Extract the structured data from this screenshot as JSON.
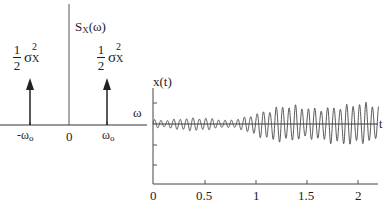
{
  "chart_data": [
    {
      "type": "spectral-impulses",
      "title": "",
      "ylabel": "S_X(ω)",
      "xlabel": "ω",
      "x_ticks": [
        "-ω0",
        "0",
        "ω0"
      ],
      "impulses": [
        {
          "x": "-ω0",
          "weight_label": "1/2 σ_X^2"
        },
        {
          "x": "ω0",
          "weight_label": "1/2 σ_X^2"
        }
      ],
      "grid": false
    },
    {
      "type": "line",
      "title": "",
      "ylabel": "x(t)",
      "xlabel": "t",
      "x_ticks": [
        0,
        0.5,
        1,
        1.5,
        2
      ],
      "xlim": [
        0,
        2.2
      ],
      "description": "sinusoid with randomly varying amplitude; small amplitude for t<0.9, growing after ~0.9",
      "envelope": {
        "t": [
          0,
          0.1,
          0.2,
          0.3,
          0.4,
          0.5,
          0.6,
          0.7,
          0.8,
          0.9,
          1.0,
          1.1,
          1.2,
          1.3,
          1.4,
          1.5,
          1.6,
          1.7,
          1.8,
          1.9,
          2.0,
          2.1,
          2.2
        ],
        "amplitude": [
          0.5,
          0.4,
          0.55,
          0.7,
          0.75,
          0.7,
          0.6,
          0.4,
          0.5,
          0.8,
          1.3,
          1.6,
          2.0,
          2.1,
          2.0,
          1.8,
          1.8,
          2.0,
          2.2,
          2.3,
          2.4,
          2.3,
          2.1
        ]
      },
      "grid": false
    }
  ],
  "left": {
    "y_axis_label_main": "S",
    "y_axis_label_sub": "X",
    "y_axis_label_arg": "(ω)",
    "x_axis_label": "ω",
    "ticks": {
      "neg": "-ω",
      "neg_sub": "o",
      "zero": "0",
      "pos": "ω",
      "pos_sub": "o"
    },
    "impulse_left": {
      "num": "1",
      "den": "2",
      "sigma": "σ",
      "sup": "2",
      "sub": "X"
    },
    "impulse_right": {
      "num": "1",
      "den": "2",
      "sigma": "σ",
      "sup": "2",
      "sub": "X"
    }
  },
  "right": {
    "y_axis_label": "x(t)",
    "x_axis_label": "t",
    "ticks": [
      "0",
      "0.5",
      "1",
      "1.5",
      "2"
    ]
  }
}
